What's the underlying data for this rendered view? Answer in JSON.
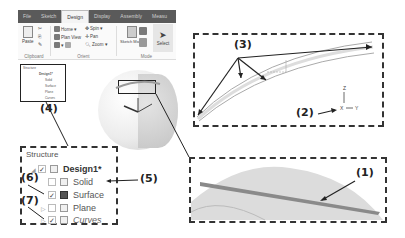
{
  "ribbon": {
    "tabs": [
      {
        "label": "File",
        "active": false
      },
      {
        "label": "Sketch",
        "active": false
      },
      {
        "label": "Design",
        "active": true
      },
      {
        "label": "Display",
        "active": false
      },
      {
        "label": "Assembly",
        "active": false
      },
      {
        "label": "Measu",
        "active": false
      }
    ],
    "groups": {
      "clipboard": {
        "label": "Clipboard",
        "paste": "Paste"
      },
      "orient": {
        "label": "Orient",
        "home": "Home",
        "spin": "Spin",
        "plan_view": "Plan View",
        "pan": "Pan",
        "zoom": "Zoom"
      },
      "mode": {
        "label": "Mode",
        "sketch_mode": "Sketch Mode",
        "select": "Select"
      }
    }
  },
  "mini_tree": {
    "title": "Structure",
    "items": [
      "Design1*",
      "Solid",
      "Surface",
      "Plane",
      "Curves"
    ]
  },
  "structure": {
    "title": "Structure",
    "items": [
      {
        "label": "Design1*",
        "checked": true,
        "style": "bold",
        "expander": "◢"
      },
      {
        "label": "Solid",
        "checked": false,
        "style": "normal",
        "expander": ""
      },
      {
        "label": "Surface",
        "checked": true,
        "style": "normal",
        "expander": ""
      },
      {
        "label": "Plane",
        "checked": false,
        "style": "normal",
        "expander": "▷"
      },
      {
        "label": "Curves",
        "checked": true,
        "style": "italic",
        "expander": "▷"
      }
    ]
  },
  "axes": {
    "x": "X",
    "y": "Y",
    "z": "Z"
  },
  "callouts": {
    "c1": "(1)",
    "c2": "(2)",
    "c3": "(3)",
    "c4": "(4)",
    "c5": "(5)",
    "c6": "(6)",
    "c7": "(7)"
  },
  "colors": {
    "tabbar": "#5a5a5a",
    "dash": "#333333",
    "surface_strip": "#8a8a8a",
    "dome": "#d8d8d8"
  }
}
